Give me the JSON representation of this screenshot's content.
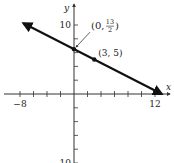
{
  "chart_data": {
    "type": "line",
    "title": "",
    "xlabel": "x",
    "ylabel": "y",
    "xlim": [
      -8,
      13
    ],
    "ylim": [
      -10,
      10
    ],
    "x_tick_step": 2,
    "y_tick_step": 2,
    "x_tick_labels": [
      {
        "value": -8,
        "label": "−8"
      },
      {
        "value": 12,
        "label": "12"
      }
    ],
    "y_tick_labels": [
      {
        "value": 10,
        "label": "10"
      },
      {
        "value": -10,
        "label": "−10"
      }
    ],
    "grid": false,
    "series": [
      {
        "name": "line",
        "equation": "y = -x/2 + 13/2",
        "x": [
          -7.5,
          13
        ],
        "y": [
          10.25,
          0
        ],
        "arrows": "both"
      }
    ],
    "points": [
      {
        "x": 0,
        "y": 6.5,
        "label": "(0, 13/2)",
        "label_main": "(0, ",
        "frac_num": "13",
        "frac_den": "2",
        "label_close": ")",
        "leader": true
      },
      {
        "x": 3,
        "y": 5,
        "label": "(3, 5)"
      }
    ]
  }
}
